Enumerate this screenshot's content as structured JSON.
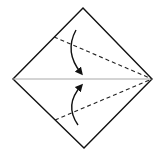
{
  "diagram": {
    "type": "origami-fold-step",
    "colors": {
      "background": "#ffffff",
      "outline": "#111111",
      "crease": "#a8a8a8",
      "fold_line": "#222222",
      "arrow": "#111111"
    },
    "shape": {
      "kind": "diamond",
      "vertices": {
        "top": [
          83,
          8
        ],
        "right": [
          152,
          79
        ],
        "bottom": [
          84,
          148
        ],
        "left": [
          13,
          79
        ]
      }
    },
    "center_crease": {
      "style": "solid-thin",
      "from": [
        13,
        79
      ],
      "to": [
        152,
        79
      ]
    },
    "valley_folds": [
      {
        "style": "dashed",
        "from": [
          54,
          37
        ],
        "to": [
          152,
          79
        ]
      },
      {
        "style": "dashed",
        "from": [
          55,
          120
        ],
        "to": [
          152,
          79
        ]
      }
    ],
    "arrows": [
      {
        "name": "fold-down-arrow",
        "start": [
          76,
          30
        ],
        "control": [
          64,
          52
        ],
        "end": [
          81,
          73
        ]
      },
      {
        "name": "fold-up-arrow",
        "start": [
          78,
          125
        ],
        "control": [
          64,
          105
        ],
        "end": [
          81,
          86
        ]
      }
    ]
  }
}
